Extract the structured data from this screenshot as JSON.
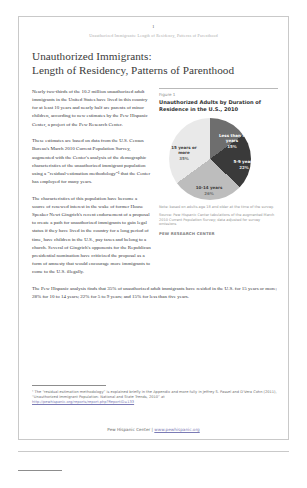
{
  "page": {
    "number": "1",
    "running_header": "Unauthorized Immigrants: Length of Residency, Patterns of Parenthood"
  },
  "title": {
    "line1": "Unauthorized Immigrants:",
    "line2": "Length of Residency, Patterns of Parenthood"
  },
  "paragraphs": {
    "p1": "Nearly two-thirds of the 10.2 million unauthorized adult immigrants in the United States have lived in this country for at least 10 years and nearly half are parents of minor children, according to new estimates by the Pew Hispanic Center, a project of the Pew Research Center.",
    "p2": "These estimates are based on data from the U.S. Census Bureau's March 2010 Current Population Survey, augmented with the Center's analysis of the demographic characteristics of the unauthorized immigrant population using a “residual-estimation methodology”¹ that the Center has employed for many years.",
    "p3": "The characteristics of this population have become a source of renewed interest in the wake of former House Speaker Newt Gingrich's recent endorsement of a proposal to create a path for unauthorized immigrants to gain legal status if they have lived in the country for a long period of time, have children in the U.S., pay taxes and belong to a church. Several of Gingrich's opponents for the Republican presidential nomination have criticized the proposal as a form of amnesty that would encourage more immigrants to come to the U.S. illegally.",
    "p4": "The Pew Hispanic analysis finds that 35% of unauthorized adult immigrants have resided in the U.S. for 15 years or more; 28% for 10 to 14 years; 22% for 5 to 9 years; and 15% for less than five years."
  },
  "figure": {
    "label": "Figure 1",
    "title": "Unauthorized Adults by Duration of Residence in the U.S., 2010",
    "note": "Note: based on adults age 18 and older at the time of the survey.",
    "source": "Source: Pew Hispanic Center tabulations of the augmented March 2010 Current Population Survey; data adjusted for survey omissions",
    "brand": "PEW RESEARCH CENTER"
  },
  "chart_data": {
    "type": "pie",
    "title": "Unauthorized Adults by Duration of Residence in the U.S., 2010",
    "categories": [
      "Less than 5 years",
      "5-9 years",
      "10-14 years",
      "15 years or more"
    ],
    "values": [
      15,
      22,
      28,
      35
    ],
    "value_labels": [
      "15%",
      "22%",
      "26%",
      "35%"
    ],
    "colors": [
      "#6e6e6e",
      "#3a3a3a",
      "#bdbdbd",
      "#e9e9e9"
    ],
    "label_text_colors": [
      "#ffffff",
      "#ffffff",
      "#3b3b3b",
      "#3b3b3b"
    ],
    "unit": "percent",
    "legend": "none",
    "labels_inline": true
  },
  "footnote": {
    "text": "¹ The “residual-estimation methodology” is explained briefly in the Appendix and more fully in Jeffrey S. Passel and D'Vera Cohn (2011), “Unauthorized Immigrant Population: National and State Trends, 2010” at",
    "link": "http://pewhispanic.org/reports/report.php?ReportID=133"
  },
  "footer": {
    "text": "Pew Hispanic Center  |  ",
    "link": "www.pewhispanic.org"
  }
}
